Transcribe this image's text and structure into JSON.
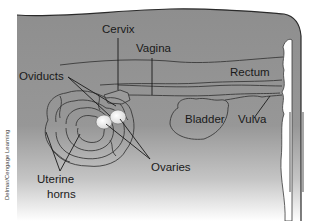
{
  "figure": {
    "colors": {
      "body_fill": "#8f8f8f",
      "outline": "#3a3a3a",
      "ovary_fill": "#f2f2f2",
      "background": "#ffffff"
    }
  },
  "labels": {
    "cervix": "Cervix",
    "vagina": "Vagina",
    "rectum": "Rectum",
    "oviducts": "Oviducts",
    "bladder": "Bladder",
    "vulva": "Vulva",
    "ovaries": "Ovaries",
    "uterine_horns_line1": "Uterine",
    "uterine_horns_line2": "horns"
  },
  "credit": "Delmar/Cengage Learning"
}
